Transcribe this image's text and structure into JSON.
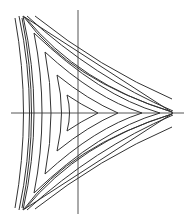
{
  "diagram": {
    "type": "contour-plot",
    "colors": {
      "background": "#ffffff",
      "curves": "#333333",
      "axes": "#555555"
    },
    "axes": {
      "horizontal": {
        "x1": 11,
        "y1": 113,
        "x2": 184,
        "y2": 113
      },
      "vertical": {
        "x1": 78,
        "y1": 10,
        "x2": 78,
        "y2": 214
      }
    },
    "cusps": [
      [
        173,
        113
      ],
      [
        23,
        16
      ],
      [
        23,
        210
      ]
    ],
    "curves": [
      {
        "name": "inner-triangle-1",
        "d": "M98,113 Q80,104 67,95 Q72,113 67,131 Q80,122 98,113 Z"
      },
      {
        "name": "inner-triangle-2",
        "d": "M118,113 Q88,100 57,75 Q66,113 57,151 Q88,126 118,113 Z"
      },
      {
        "name": "inner-triangle-3",
        "d": "M142,113 Q95,98 45,52 Q57,113 45,174 Q95,128 142,113 Z"
      },
      {
        "name": "inner-triangle-4",
        "d": "M160,113 Q100,96 34,33 Q50,113 34,193 Q100,130 160,113 Z"
      },
      {
        "name": "separatrix-a",
        "d": "M23,16 L173,113"
      },
      {
        "name": "separatrix-b",
        "d": "M23,210 L173,113"
      },
      {
        "name": "separatrix-c",
        "d": "M23,16 Q45,113 23,210"
      },
      {
        "name": "outer-left-1",
        "d": "M19,16 Q40,113 19,210"
      },
      {
        "name": "outer-left-2",
        "d": "M15,18 Q32,113 15,208"
      },
      {
        "name": "outer-top-1",
        "d": "M27,16 Q95,78 173,111"
      },
      {
        "name": "outer-top-2",
        "d": "M35,16 Q100,68 172,99"
      },
      {
        "name": "outer-bottom-1",
        "d": "M27,210 Q95,148 173,115"
      },
      {
        "name": "outer-bottom-2",
        "d": "M35,209 Q100,158 172,127"
      },
      {
        "name": "mid-top-1",
        "d": "M24,17 Q70,80 172,112"
      },
      {
        "name": "mid-top-2",
        "d": "M25,17 Q80,84 172,112"
      },
      {
        "name": "mid-bottom-1",
        "d": "M24,209 Q70,146 172,114"
      },
      {
        "name": "mid-bottom-2",
        "d": "M25,209 Q80,142 172,114"
      },
      {
        "name": "mid-left-1",
        "d": "M22,18 Q41,113 22,208"
      }
    ]
  }
}
